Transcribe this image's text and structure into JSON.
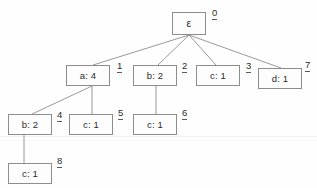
{
  "diagram": {
    "type": "trie",
    "title": "",
    "background_color": "#fefefe",
    "node_border_color": "#8d8d8d",
    "edge_color": "#8d8d8d",
    "text_color": "#2b2b2b",
    "nodes": [
      {
        "id": "n0",
        "index": "0",
        "label": "ε",
        "symbol": "ε",
        "count": "",
        "depth": 0,
        "box": {
          "x": 172,
          "y": 12,
          "w": 34,
          "h": 23
        },
        "index_pos": {
          "x": 212,
          "y": 8
        }
      },
      {
        "id": "n1",
        "index": "1",
        "label": "a: 4",
        "symbol": "a",
        "count": "4",
        "depth": 1,
        "box": {
          "x": 66,
          "y": 65,
          "w": 44,
          "h": 21
        },
        "index_pos": {
          "x": 117,
          "y": 61
        }
      },
      {
        "id": "n2",
        "index": "2",
        "label": "b: 2",
        "symbol": "b",
        "count": "2",
        "depth": 1,
        "box": {
          "x": 133,
          "y": 65,
          "w": 44,
          "h": 21
        },
        "index_pos": {
          "x": 182,
          "y": 61
        }
      },
      {
        "id": "n3",
        "index": "3",
        "label": "c: 1",
        "symbol": "c",
        "count": "1",
        "depth": 1,
        "box": {
          "x": 196,
          "y": 65,
          "w": 44,
          "h": 21
        },
        "index_pos": {
          "x": 246,
          "y": 61
        }
      },
      {
        "id": "n7",
        "index": "7",
        "label": "d: 1",
        "symbol": "d",
        "count": "1",
        "depth": 1,
        "box": {
          "x": 258,
          "y": 68,
          "w": 44,
          "h": 21
        },
        "index_pos": {
          "x": 305,
          "y": 60
        }
      },
      {
        "id": "n4",
        "index": "4",
        "label": "b: 2",
        "symbol": "b",
        "count": "2",
        "depth": 2,
        "box": {
          "x": 8,
          "y": 114,
          "w": 44,
          "h": 21
        },
        "index_pos": {
          "x": 57,
          "y": 110
        }
      },
      {
        "id": "n5",
        "index": "5",
        "label": "c: 1",
        "symbol": "c",
        "count": "1",
        "depth": 2,
        "box": {
          "x": 69,
          "y": 114,
          "w": 44,
          "h": 21
        },
        "index_pos": {
          "x": 118,
          "y": 108
        }
      },
      {
        "id": "n6",
        "index": "6",
        "label": "c: 1",
        "symbol": "c",
        "count": "1",
        "depth": 2,
        "box": {
          "x": 133,
          "y": 114,
          "w": 44,
          "h": 21
        },
        "index_pos": {
          "x": 182,
          "y": 108
        }
      },
      {
        "id": "n8",
        "index": "8",
        "label": "c: 1",
        "symbol": "c",
        "count": "1",
        "depth": 3,
        "box": {
          "x": 8,
          "y": 163,
          "w": 44,
          "h": 21
        },
        "index_pos": {
          "x": 57,
          "y": 156
        }
      }
    ],
    "edges": [
      {
        "from": "n0",
        "to": "n1",
        "x1": 189,
        "y1": 35,
        "x2": 93,
        "y2": 65
      },
      {
        "from": "n0",
        "to": "n2",
        "x1": 189,
        "y1": 35,
        "x2": 158,
        "y2": 65
      },
      {
        "from": "n0",
        "to": "n3",
        "x1": 189,
        "y1": 35,
        "x2": 216,
        "y2": 65
      },
      {
        "from": "n0",
        "to": "n7",
        "x1": 189,
        "y1": 35,
        "x2": 281,
        "y2": 68
      },
      {
        "from": "n1",
        "to": "n4",
        "x1": 92,
        "y1": 86,
        "x2": 32,
        "y2": 114
      },
      {
        "from": "n1",
        "to": "n5",
        "x1": 92,
        "y1": 86,
        "x2": 92,
        "y2": 114
      },
      {
        "from": "n2",
        "to": "n6",
        "x1": 156,
        "y1": 86,
        "x2": 156,
        "y2": 114
      },
      {
        "from": "n4",
        "to": "n8",
        "x1": 24,
        "y1": 135,
        "x2": 24,
        "y2": 163
      }
    ]
  }
}
